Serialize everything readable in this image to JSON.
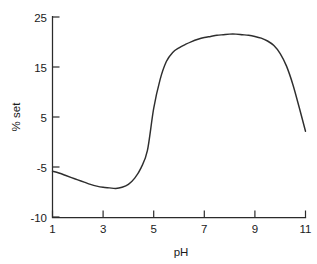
{
  "chart_data": {
    "type": "line",
    "title": "",
    "xlabel": "pH",
    "ylabel": "% set",
    "xlim": [
      1,
      11
    ],
    "ylim": [
      -10,
      25
    ],
    "grid": false,
    "legend": false,
    "legend_position": "none",
    "xticks": [
      1,
      3,
      5,
      7,
      9,
      11
    ],
    "xtick_labels": [
      "1",
      "3",
      "5",
      "7",
      "9",
      "11"
    ],
    "yticks": [
      -10,
      -5,
      5,
      15,
      25
    ],
    "ytick_labels": [
      "-10",
      "-5",
      "5",
      "15",
      "25"
    ],
    "series": [
      {
        "name": "% set vs pH",
        "color": "#2e2e2e",
        "x": [
          1.0,
          1.25,
          1.5,
          1.75,
          2.0,
          2.25,
          2.5,
          2.75,
          3.0,
          3.25,
          3.5,
          3.75,
          4.0,
          4.25,
          4.5,
          4.75,
          5.0,
          5.25,
          5.5,
          5.75,
          6.0,
          6.25,
          6.5,
          6.75,
          7.0,
          7.25,
          7.5,
          7.75,
          8.0,
          8.25,
          8.5,
          8.75,
          9.0,
          9.25,
          9.5,
          9.75,
          10.0,
          10.25,
          10.5,
          10.75,
          11.0
        ],
        "y": [
          -2.0,
          -2.3,
          -2.7,
          -3.1,
          -3.5,
          -3.9,
          -4.3,
          -4.6,
          -4.8,
          -4.9,
          -5.0,
          -4.8,
          -4.3,
          -3.2,
          -1.4,
          1.6,
          9.0,
          14.0,
          17.2,
          18.8,
          19.6,
          20.2,
          20.7,
          21.1,
          21.4,
          21.6,
          21.8,
          21.9,
          22.0,
          22.0,
          21.9,
          21.8,
          21.6,
          21.3,
          20.8,
          20.0,
          18.6,
          16.4,
          13.2,
          9.2,
          5.0
        ]
      }
    ],
    "annotations": []
  },
  "axes": {
    "y_axis_name": "y-axis",
    "x_axis_name": "x-axis"
  }
}
